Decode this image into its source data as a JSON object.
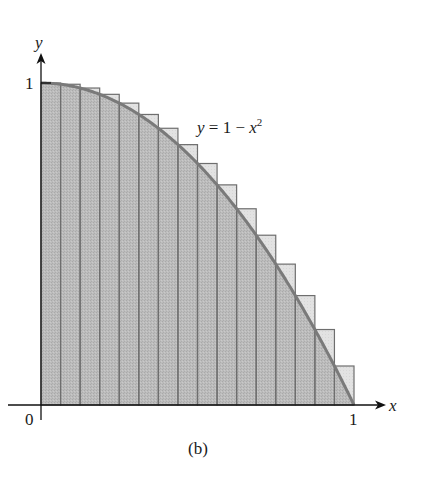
{
  "figure": {
    "caption": "(b)",
    "curve_label": {
      "lhs": "y",
      "eq": " = 1 − ",
      "var": "x",
      "exp": "2"
    },
    "axis_x_label": "x",
    "axis_y_label": "y",
    "tick_origin": "0",
    "tick_x_one": "1",
    "tick_y_one": "1"
  },
  "colors": {
    "under_curve": "#b9b9b9",
    "over_curve": "#e2e2e2",
    "bar_outline": "#6e6e6e",
    "curve": "#7a7a7a",
    "axis": "#111111"
  },
  "chart_data": {
    "type": "bar",
    "title": "",
    "caption": "(b)",
    "function": "y = 1 - x^2",
    "n_rectangles": 16,
    "xlabel": "x",
    "ylabel": "y",
    "xlim": [
      0,
      1
    ],
    "ylim": [
      0,
      1
    ],
    "x_ticks": [
      "0",
      "1"
    ],
    "y_ticks": [
      "1"
    ],
    "grid": false,
    "categories": [
      "0",
      "0.0625",
      "0.125",
      "0.1875",
      "0.25",
      "0.3125",
      "0.375",
      "0.4375",
      "0.5",
      "0.5625",
      "0.625",
      "0.6875",
      "0.75",
      "0.8125",
      "0.875",
      "0.9375"
    ],
    "values": [
      1.0,
      0.9961,
      0.9844,
      0.9648,
      0.9375,
      0.9023,
      0.8594,
      0.8086,
      0.75,
      0.6836,
      0.6094,
      0.5273,
      0.4375,
      0.3398,
      0.2344,
      0.1211
    ],
    "annotations": [
      "y = 1 − x^2"
    ]
  }
}
